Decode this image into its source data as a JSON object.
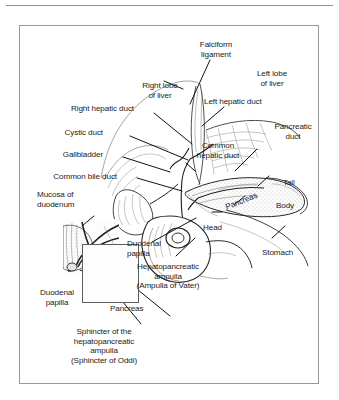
{
  "figure": {
    "border_color": "#9a9a9a",
    "rule_color": "#8e8e8e",
    "ink_color": "#1a1a1a",
    "background": "#ffffff"
  },
  "labels": {
    "falciform_ligament": "Falciform\nligament",
    "right_lobe_of_liver": "Right lobe\nof liver",
    "left_lobe_of_liver": "Left lobe\nof liver",
    "right_hepatic_duct": "Right hepatic duct",
    "left_hepatic_duct": "Left hepatic duct",
    "cystic_duct": "Cystic duct",
    "gallbladder": "Gallbladder",
    "common_bile_duct": "Common bile duct",
    "common_hepatic_duct": "Common\nhepatic duct",
    "pancreatic_duct": "Pancreatic\nduct",
    "tail": "Tail",
    "body": "Body",
    "head": "Head",
    "pancreas_inline": "Pancreas",
    "stomach": "Stomach",
    "mucosa_of_duodenum": "Mucosa of\nduodenum",
    "duodenal_papilla_right": "Duodenal\npapilla",
    "duodenal_papilla_left": "Duodenal\npapilla",
    "hepatopancreatic_ampulla": "Hepatopancreatic\nampulla\n(Ampulla of Vater)",
    "pancreas_bottom": "Pancreas",
    "sphincter": "Sphincter of the\nhepatopancreatic\nampulla\n(Sphincter of Oddi)"
  }
}
